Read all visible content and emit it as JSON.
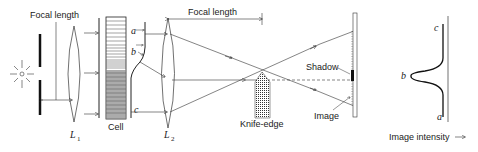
{
  "diagram": {
    "labels": {
      "focal_length_1": "Focal length",
      "focal_length_2": "Focal length",
      "lens1": "L",
      "lens1_sub": "1",
      "cell": "Cell",
      "lens2": "L",
      "lens2_sub": "2",
      "knife_edge": "Knife-edge",
      "shadow": "Shadow",
      "image": "Image",
      "point_a": "a",
      "point_b": "b",
      "point_c": "c",
      "plot_a": "a",
      "plot_b": "b",
      "plot_c": "c",
      "image_intensity": "Image intensity"
    },
    "icons": [
      "light-source-icon",
      "arrow-right-icon"
    ],
    "colors": {
      "line": "#222222",
      "background": "#ffffff"
    }
  }
}
